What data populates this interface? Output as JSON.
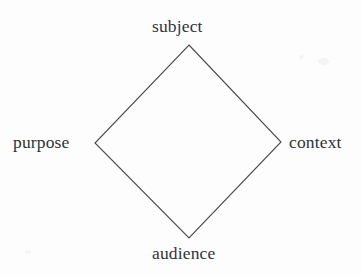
{
  "figure": {
    "type": "diagram",
    "shape": "diamond",
    "stroke_color": "#4a4a4a",
    "stroke_width": 1,
    "fill": "none",
    "background_color": "#fdfdfd",
    "text_color": "#333333",
    "vertices": {
      "top": {
        "x": 189,
        "y": 45
      },
      "right": {
        "x": 281,
        "y": 142
      },
      "bottom": {
        "x": 189,
        "y": 238
      },
      "left": {
        "x": 95,
        "y": 143
      }
    },
    "labels": {
      "top": "subject",
      "right": "context",
      "bottom": "audience",
      "left": "purpose"
    }
  }
}
